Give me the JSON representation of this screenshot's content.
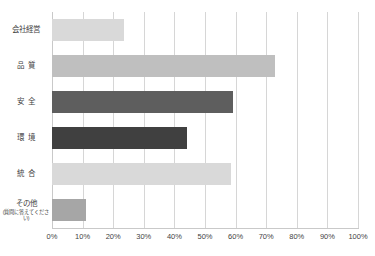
{
  "chart_data": {
    "type": "bar",
    "orientation": "horizontal",
    "title": "",
    "xlabel": "",
    "ylabel": "",
    "categories": [
      "会社経営",
      "品　質",
      "安　全",
      "環　境",
      "統　合",
      "その他"
    ],
    "category_sublabels": [
      "",
      "",
      "",
      "",
      "",
      "(質問に答えてください)"
    ],
    "values": [
      23.5,
      73.0,
      59.0,
      44.0,
      58.5,
      11.0
    ],
    "bar_colors": [
      "#d9d9d9",
      "#bfbfbf",
      "#5e5e5e",
      "#404040",
      "#d9d9d9",
      "#a6a6a6"
    ],
    "xlim": [
      0,
      100
    ],
    "xtick_values": [
      0,
      10,
      20,
      30,
      40,
      50,
      60,
      70,
      80,
      90,
      100
    ],
    "xtick_labels": [
      "0%",
      "10%",
      "20%",
      "30%",
      "40%",
      "50%",
      "60%",
      "70%",
      "80%",
      "90%",
      "100%"
    ],
    "grid": true,
    "grid_axis": "x",
    "legend": false,
    "legend_position": "none",
    "gridline_color": "#d6d6d6",
    "axis_color": "#c9c9c9",
    "background_color": "#ffffff",
    "text_color": "#3f3f3f"
  }
}
